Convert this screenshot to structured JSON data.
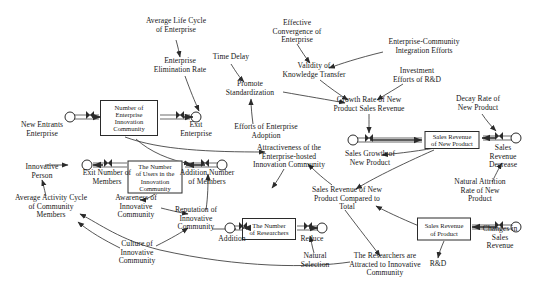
{
  "diagram": {
    "type": "stock-and-flow",
    "width": 540,
    "height": 292,
    "background": "#ffffff",
    "stroke_color": "#2b2b2b",
    "text_color": "#171717"
  },
  "stocks": [
    {
      "id": "stock_enterprise_community",
      "label": "Number of\nEnterprise\nInnovation\nCommunity",
      "x": 129,
      "y": 118,
      "w": 58,
      "h": 36
    },
    {
      "id": "stock_users",
      "label": "The Number\nof Users in the\nInnovation\nCommunity",
      "x": 155,
      "y": 177,
      "w": 55,
      "h": 33
    },
    {
      "id": "stock_researchers",
      "label": "The Number\nof Researchers",
      "x": 269,
      "y": 229,
      "w": 54,
      "h": 22
    },
    {
      "id": "stock_sales_rev_new_product",
      "label": "Sales Revenue\nof New Product",
      "x": 452,
      "y": 140,
      "w": 55,
      "h": 18
    },
    {
      "id": "stock_sales_rev_product",
      "label": "Sales Revenue\nof Product",
      "x": 444,
      "y": 229,
      "w": 54,
      "h": 23
    }
  ],
  "clouds": [
    {
      "id": "cloud_new_entrants",
      "x": 70,
      "y": 117
    },
    {
      "id": "cloud_exit_enterprise",
      "x": 196,
      "y": 117
    },
    {
      "id": "cloud_exit_members",
      "x": 87,
      "y": 165
    },
    {
      "id": "cloud_addition_members",
      "x": 222,
      "y": 165
    },
    {
      "id": "cloud_growth_new_product",
      "x": 353,
      "y": 140
    },
    {
      "id": "cloud_sales_rev_decrease",
      "x": 516,
      "y": 138
    },
    {
      "id": "cloud_reduce",
      "x": 322,
      "y": 228
    },
    {
      "id": "cloud_changes_sales_rev",
      "x": 516,
      "y": 227
    },
    {
      "id": "cloud_addition_researchers",
      "x": 230,
      "y": 228
    }
  ],
  "valves": [
    {
      "id": "valve_new_entrants",
      "x": 90,
      "y": 117
    },
    {
      "id": "valve_exit_enterprise",
      "x": 180,
      "y": 117
    },
    {
      "id": "valve_exit_members",
      "x": 108,
      "y": 165
    },
    {
      "id": "valve_addition_members",
      "x": 205,
      "y": 165
    },
    {
      "id": "valve_growth_new_product",
      "x": 369,
      "y": 140
    },
    {
      "id": "valve_sales_rev_decrease",
      "x": 499,
      "y": 138
    },
    {
      "id": "valve_reduce",
      "x": 308,
      "y": 228
    },
    {
      "id": "valve_changes_sales_rev",
      "x": 499,
      "y": 227
    },
    {
      "id": "valve_addition_researchers",
      "x": 243,
      "y": 228
    }
  ],
  "variables": [
    {
      "id": "var_avg_life_cycle",
      "label": "Average Life Cycle\nof Enterprise",
      "x": 176,
      "y": 26
    },
    {
      "id": "var_enterprise_elim_rate",
      "label": "Enterprise\nElimination Rate",
      "x": 180,
      "y": 66
    },
    {
      "id": "var_time_delay",
      "label": "Time Delay",
      "x": 231,
      "y": 57
    },
    {
      "id": "var_promote_standardization",
      "label": "Promote\nStandardization",
      "x": 250,
      "y": 89
    },
    {
      "id": "var_effective_convergence",
      "label": "Effective\nConvergence of\nEnterprise",
      "x": 297,
      "y": 32
    },
    {
      "id": "var_validity_knowledge",
      "label": "Validity of\nKnowledge Transfer",
      "x": 314,
      "y": 71
    },
    {
      "id": "var_enterprise_community_integration",
      "label": "Enterprise-Community\nIntegration Efforts",
      "x": 424,
      "y": 47
    },
    {
      "id": "var_investment_rd",
      "label": "Investment\nEfforts of R&D",
      "x": 417,
      "y": 76
    },
    {
      "id": "var_growth_rate_sales",
      "label": "Growth Rate of New\nProduct Sales Revenue",
      "x": 369,
      "y": 105
    },
    {
      "id": "var_decay_rate",
      "label": "Decay Rate of\nNew Product",
      "x": 478,
      "y": 104
    },
    {
      "id": "var_new_entrants_enterprise",
      "label": "New Entrants\nEnterprise",
      "x": 42,
      "y": 130
    },
    {
      "id": "var_exit_enterprise",
      "label": "Exit\nEnterprise",
      "x": 196,
      "y": 130
    },
    {
      "id": "var_efforts_enterprise_adoption",
      "label": "Efforts of Enterprise\nAdoption",
      "x": 266,
      "y": 132
    },
    {
      "id": "var_attractiveness",
      "label": "Attractiveness of the\nEnterprise-hosted\nInnovation Community",
      "x": 289,
      "y": 157
    },
    {
      "id": "var_sales_growth",
      "label": "Sales Growth of\nNew Product",
      "x": 370,
      "y": 159
    },
    {
      "id": "var_sales_rev_decrease_lbl",
      "label": "Sales Revenue\nDecrease",
      "x": 503,
      "y": 157
    },
    {
      "id": "var_innovative_person",
      "label": "Innovative\nPerson",
      "x": 42,
      "y": 172
    },
    {
      "id": "var_exit_number_members",
      "label": "Exit Number of\nMembers",
      "x": 107,
      "y": 178
    },
    {
      "id": "var_addition_number_members",
      "label": "Addition Number\nof Members",
      "x": 207,
      "y": 178
    },
    {
      "id": "var_avg_activity_cycle",
      "label": "Average Activity Cycle\nof Community\nMembers",
      "x": 51,
      "y": 207
    },
    {
      "id": "var_awareness",
      "label": "Awareness of\nInnovative\nCommunity",
      "x": 136,
      "y": 207
    },
    {
      "id": "var_reputation",
      "label": "Reputation of\nInnovative\nCommunity",
      "x": 196,
      "y": 219
    },
    {
      "id": "var_culture",
      "label": "Culture of\nInnovative\nCommunity",
      "x": 137,
      "y": 253
    },
    {
      "id": "var_addition_lbl",
      "label": "Addition",
      "x": 232,
      "y": 239
    },
    {
      "id": "var_reduce_lbl",
      "label": "Reduce",
      "x": 312,
      "y": 239
    },
    {
      "id": "var_natural_selection",
      "label": "Natural\nSelection",
      "x": 315,
      "y": 261
    },
    {
      "id": "var_sales_rev_compared",
      "label": "Sales Revenue of New\nProduct Compared to\nTotal",
      "x": 347,
      "y": 199
    },
    {
      "id": "var_natural_attrition",
      "label": "Natural Attrition\nRate of New Product",
      "x": 480,
      "y": 191
    },
    {
      "id": "var_changes_sales_rev_lbl",
      "label": "Changes in Sales\nRevenue",
      "x": 500,
      "y": 238
    },
    {
      "id": "var_researchers_attracted",
      "label": "The Researchers are\nAttracted to Innovative\nCommunity",
      "x": 385,
      "y": 265
    },
    {
      "id": "var_rd",
      "label": "R&D",
      "x": 438,
      "y": 264
    }
  ],
  "influence_links": [
    {
      "from": "var_avg_life_cycle",
      "to": "var_enterprise_elim_rate"
    },
    {
      "from": "var_enterprise_elim_rate",
      "to": "valve_exit_enterprise"
    },
    {
      "from": "var_time_delay",
      "to": "var_promote_standardization"
    },
    {
      "from": "var_promote_standardization",
      "to": "var_growth_rate_sales"
    },
    {
      "from": "var_efforts_enterprise_adoption",
      "to": "var_promote_standardization"
    },
    {
      "from": "var_effective_convergence",
      "to": "var_validity_knowledge"
    },
    {
      "from": "var_enterprise_community_integration",
      "to": "var_validity_knowledge"
    },
    {
      "from": "var_validity_knowledge",
      "to": "var_growth_rate_sales"
    },
    {
      "from": "var_investment_rd",
      "to": "var_growth_rate_sales"
    },
    {
      "from": "var_growth_rate_sales",
      "to": "valve_growth_new_product"
    },
    {
      "from": "var_decay_rate",
      "to": "valve_sales_rev_decrease"
    },
    {
      "from": "var_natural_attrition",
      "to": "var_sales_rev_decrease_lbl"
    },
    {
      "from": "stock_sales_rev_new_product",
      "to": "var_sales_growth"
    },
    {
      "from": "stock_sales_rev_new_product",
      "to": "var_sales_rev_compared"
    },
    {
      "from": "stock_sales_rev_product",
      "to": "var_sales_rev_compared"
    },
    {
      "from": "stock_sales_rev_product",
      "to": "var_rd"
    },
    {
      "from": "var_sales_rev_compared",
      "to": "var_attractiveness"
    },
    {
      "from": "var_sales_rev_compared",
      "to": "var_researchers_attracted"
    },
    {
      "from": "var_attractiveness",
      "to": "var_efforts_enterprise_adoption"
    },
    {
      "from": "var_researchers_attracted",
      "to": "var_avg_activity_cycle"
    },
    {
      "from": "stock_enterprise_community",
      "to": "var_attractiveness"
    },
    {
      "from": "stock_users",
      "to": "var_awareness"
    },
    {
      "from": "var_awareness",
      "to": "var_reputation"
    },
    {
      "from": "var_culture",
      "to": "var_reputation"
    },
    {
      "from": "var_culture",
      "to": "var_avg_activity_cycle"
    },
    {
      "from": "var_reputation",
      "to": "valve_addition_researchers"
    },
    {
      "from": "var_reputation",
      "to": "var_addition_number_members"
    },
    {
      "from": "var_avg_activity_cycle",
      "to": "var_innovative_person"
    },
    {
      "from": "var_innovative_person",
      "to": "valve_exit_members"
    },
    {
      "from": "var_natural_selection",
      "to": "valve_reduce"
    },
    {
      "from": "stock_enterprise_community",
      "to": "var_addition_number_members"
    }
  ],
  "flows": [
    {
      "from": "cloud_new_entrants",
      "through": "valve_new_entrants",
      "to": "stock_enterprise_community",
      "label": "New Entrants Enterprise"
    },
    {
      "from": "stock_enterprise_community",
      "through": "valve_exit_enterprise",
      "to": "cloud_exit_enterprise",
      "label": "Exit Enterprise"
    },
    {
      "from": "stock_users",
      "through": "valve_exit_members",
      "to": "cloud_exit_members",
      "label": "Exit Number of Members"
    },
    {
      "from": "cloud_addition_members",
      "through": "valve_addition_members",
      "to": "stock_users",
      "label": "Addition Number of Members"
    },
    {
      "from": "cloud_growth_new_product",
      "through": "valve_growth_new_product",
      "to": "stock_sales_rev_new_product",
      "label": "Sales Growth of New Product"
    },
    {
      "from": "cloud_sales_rev_decrease",
      "through": "valve_sales_rev_decrease",
      "to": "stock_sales_rev_new_product",
      "label": "Sales Revenue Decrease"
    },
    {
      "from": "cloud_addition_researchers",
      "through": "valve_addition_researchers",
      "to": "stock_researchers",
      "label": "Addition"
    },
    {
      "from": "stock_researchers",
      "through": "valve_reduce",
      "to": "cloud_reduce",
      "label": "Reduce"
    },
    {
      "from": "cloud_changes_sales_rev",
      "through": "valve_changes_sales_rev",
      "to": "stock_sales_rev_product",
      "label": "Changes in Sales Revenue"
    }
  ]
}
